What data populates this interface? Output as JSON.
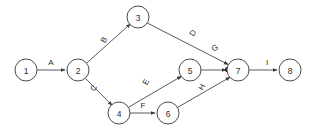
{
  "diagram": {
    "type": "directed-activity-network",
    "title": "",
    "background_color": "#ffffff",
    "line_color": "#5a5a5a",
    "text_color": "#2b2b2b",
    "node_radius": 11,
    "nodes": [
      {
        "id": "1",
        "label": "1",
        "x": 26,
        "y": 70
      },
      {
        "id": "2",
        "label": "2",
        "x": 78,
        "y": 70
      },
      {
        "id": "3",
        "label": "3",
        "x": 138,
        "y": 17
      },
      {
        "id": "4",
        "label": "4",
        "x": 119,
        "y": 113
      },
      {
        "id": "5",
        "label": "5",
        "x": 190,
        "y": 70
      },
      {
        "id": "6",
        "label": "6",
        "x": 168,
        "y": 113
      },
      {
        "id": "7",
        "label": "7",
        "x": 238,
        "y": 70
      },
      {
        "id": "8",
        "label": "8",
        "x": 290,
        "y": 70
      }
    ],
    "edges": [
      {
        "id": "A",
        "label": "A",
        "from": "1",
        "to": "2",
        "label_x": 51,
        "label_y": 62,
        "label_rotation": 0
      },
      {
        "id": "B",
        "label": "B",
        "from": "2",
        "to": "3",
        "label_x": 104,
        "label_y": 40,
        "label_rotation": -62
      },
      {
        "id": "C",
        "label": "C",
        "from": "2",
        "to": "4",
        "label_x": 94,
        "label_y": 88,
        "label_rotation": -62
      },
      {
        "id": "D",
        "label": "D",
        "from": "3",
        "to": "7",
        "label_x": 193,
        "label_y": 33,
        "label_rotation": -62
      },
      {
        "id": "E",
        "label": "E",
        "from": "4",
        "to": "5",
        "label_x": 146,
        "label_y": 82,
        "label_rotation": -62
      },
      {
        "id": "F",
        "label": "F",
        "from": "4",
        "to": "6",
        "label_x": 143,
        "label_y": 105,
        "label_rotation": 0
      },
      {
        "id": "G",
        "label": "G",
        "from": "3",
        "to": "7",
        "label_x": 215,
        "label_y": 48,
        "label_rotation": -30
      },
      {
        "id": "H",
        "label": "H",
        "from": "6",
        "to": "7",
        "label_x": 202,
        "label_y": 87,
        "label_rotation": -62
      },
      {
        "id": "I",
        "label": "I",
        "from": "7",
        "to": "8",
        "label_x": 267,
        "label_y": 62,
        "label_rotation": 0
      }
    ]
  }
}
